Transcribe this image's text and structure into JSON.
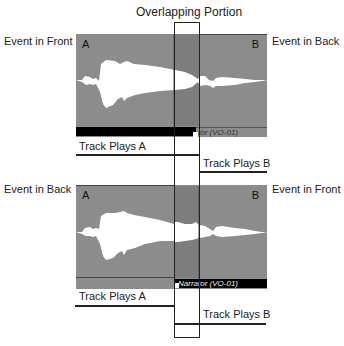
{
  "title": "Overlapping Portion",
  "top_panel": {
    "left_label": "Event in Front",
    "right_label": "Event in Back",
    "corner_a": "A",
    "corner_b": "B",
    "clip_name": "tor (VO-01)",
    "track_a": "Track Plays A",
    "track_b": "Track Plays B"
  },
  "bottom_panel": {
    "left_label": "Event in Back",
    "right_label": "Event in Front",
    "corner_a": "A",
    "corner_b": "B",
    "clip_name": "Narrator (VO-01)",
    "track_a": "Track Plays A",
    "track_b": "Track Plays B"
  },
  "colors": {
    "panel": "#8c8c8c",
    "overlap_shade": "#7a7a7a",
    "clip_bar": "#000000",
    "waveform": "#ffffff"
  }
}
